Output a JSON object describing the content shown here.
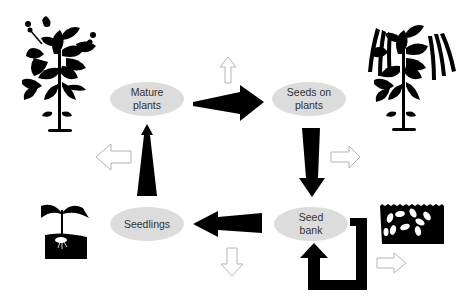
{
  "colors": {
    "node_fill": "#dcdcdc",
    "arrow_fill": "#000000",
    "hollow_arrow_stroke": "#b5b5b5",
    "background": "#ffffff"
  },
  "nodes": [
    {
      "id": "mature",
      "lines": [
        "Mature",
        "plants"
      ]
    },
    {
      "id": "seeds_on_plants",
      "lines": [
        "Seeds on",
        "plants"
      ]
    },
    {
      "id": "seedlings",
      "lines": [
        "Seedlings"
      ]
    },
    {
      "id": "seed_bank",
      "lines": [
        "Seed",
        "bank"
      ]
    }
  ],
  "transitions": [
    {
      "from": "Mature plants",
      "to": "Seeds on plants",
      "style": "solid-wide"
    },
    {
      "from": "Seeds on plants",
      "to": "Seed bank",
      "style": "solid"
    },
    {
      "from": "Seed bank",
      "to": "Seedlings",
      "style": "solid"
    },
    {
      "from": "Seedlings",
      "to": "Mature plants",
      "style": "solid-narrow"
    },
    {
      "from": "Seed bank",
      "to": "Seed bank",
      "style": "solid-loop",
      "meaning": "persistence in seed bank"
    }
  ],
  "losses": [
    {
      "from": "Mature plants",
      "direction": "up",
      "style": "hollow"
    },
    {
      "from": "Seedlings",
      "direction": "left",
      "style": "hollow"
    },
    {
      "from": "Seeds on plants",
      "direction": "right",
      "style": "hollow"
    },
    {
      "from": "Seedlings",
      "direction": "down",
      "style": "hollow"
    },
    {
      "from": "Seed bank",
      "direction": "right",
      "style": "hollow"
    }
  ],
  "illustrations": [
    {
      "name": "flowering-plant",
      "stage": "Mature plants"
    },
    {
      "name": "podded-plant",
      "stage": "Seeds on plants"
    },
    {
      "name": "sprouting-seedling",
      "stage": "Seedlings"
    },
    {
      "name": "buried-seeds",
      "stage": "Seed bank"
    }
  ]
}
